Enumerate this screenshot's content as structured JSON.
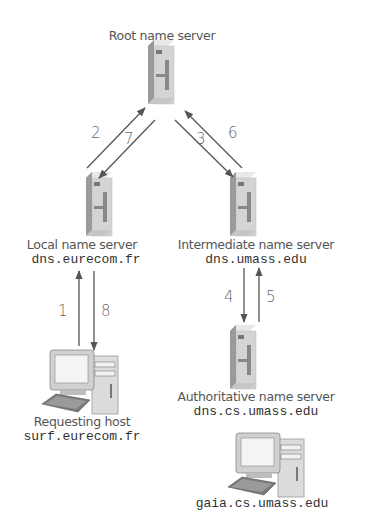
{
  "nodes": {
    "root": {
      "title": "Root name server"
    },
    "local": {
      "title": "Local name server",
      "host": "dns.eurecom.fr"
    },
    "intermediate": {
      "title": "Intermediate name server",
      "host": "dns.umass.edu"
    },
    "authoritative": {
      "title": "Authoritative name server",
      "host": "dns.cs.umass.edu"
    },
    "requesting": {
      "title": "Requesting host",
      "host": "surf.eurecom.fr"
    },
    "target": {
      "host": "gaia.cs.umass.edu"
    }
  },
  "steps": [
    "1",
    "2",
    "3",
    "4",
    "5",
    "6",
    "7",
    "8"
  ],
  "colors": {
    "arrow": "#555555",
    "server_front": "#d4d4d4",
    "server_side": "#a8a8a8",
    "server_top": "#e6e6e6",
    "text": "#555555"
  }
}
